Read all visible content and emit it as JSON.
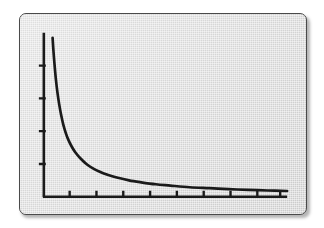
{
  "figure": {
    "panel": {
      "background_color": "#d7d7d7",
      "border_color": "#4a4a4a",
      "corner_radius_px": 7,
      "shadow": "drop-shadow-lower-right"
    },
    "ink_color": "#1a1a1a"
  },
  "chart_data": {
    "type": "line",
    "title": "",
    "subtitle": "",
    "xlabel": "",
    "ylabel": "",
    "legend": [],
    "legend_position": "none",
    "grid": false,
    "annotations": [],
    "xlim": [
      0,
      10
    ],
    "ylim": [
      0,
      10
    ],
    "xtick_labels": [],
    "ytick_labels": [],
    "xticks": [
      1,
      2,
      3,
      4,
      5,
      6,
      7,
      8,
      9
    ],
    "yticks": [
      2,
      4,
      6,
      8
    ],
    "axis_spines": [
      "left",
      "bottom"
    ],
    "tick_direction": "out",
    "series": [
      {
        "name": "y = k/x",
        "curve_family": "reciprocal",
        "x": [
          0.36,
          0.4,
          0.45,
          0.5,
          0.56,
          0.63,
          0.71,
          0.8,
          0.9,
          1.0,
          1.15,
          1.3,
          1.5,
          1.75,
          2.0,
          2.3,
          2.65,
          3.0,
          3.5,
          4.0,
          4.6,
          5.2,
          6.0,
          6.8,
          7.6,
          8.4,
          9.2,
          10.0
        ],
        "y": [
          9.7,
          8.8,
          7.9,
          7.1,
          6.35,
          5.65,
          5.0,
          4.4,
          3.9,
          3.5,
          3.05,
          2.7,
          2.35,
          2.0,
          1.75,
          1.52,
          1.32,
          1.17,
          1.0,
          0.88,
          0.76,
          0.68,
          0.58,
          0.52,
          0.46,
          0.42,
          0.38,
          0.35
        ]
      }
    ]
  }
}
